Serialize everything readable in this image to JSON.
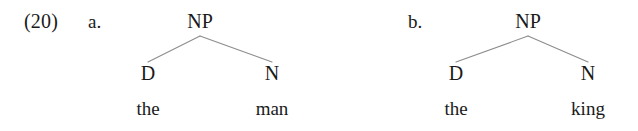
{
  "figure": {
    "example_number": "(20)",
    "text_color": "#1a1a1a",
    "branch_color": "#8d8d8d",
    "background_color": "#ffffff",
    "subexamples": [
      {
        "label": "a.",
        "tree": {
          "root": "NP",
          "left_node": "D",
          "right_node": "N",
          "left_leaf": "the",
          "right_leaf": "man"
        }
      },
      {
        "label": "b.",
        "tree": {
          "root": "NP",
          "left_node": "D",
          "right_node": "N",
          "left_leaf": "the",
          "right_leaf": "king"
        }
      }
    ]
  }
}
